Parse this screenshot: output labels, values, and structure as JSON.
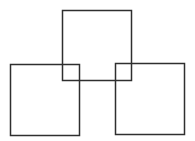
{
  "diagram": {
    "title": "",
    "stroke_color": "#2f2f2f",
    "background_color": "#ffffff",
    "shapes": [
      {
        "id": "top-square",
        "type": "square"
      },
      {
        "id": "left-square",
        "type": "square"
      },
      {
        "id": "right-square",
        "type": "square"
      }
    ]
  }
}
